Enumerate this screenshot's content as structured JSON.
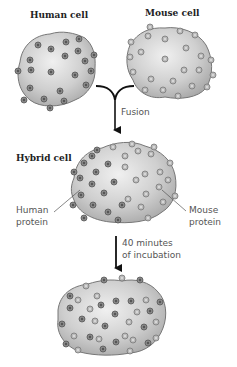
{
  "labels": {
    "human_cell": "Human cell",
    "mouse_cell": "Mouse cell",
    "fusion": "Fusion",
    "hybrid_cell": "Hybrid cell",
    "human_protein_line1": "Human",
    "human_protein_line2": "protein",
    "mouse_protein_line1": "Mouse",
    "mouse_protein_line2": "protein",
    "incubation_line1": "40 minutes",
    "incubation_line2": "of incubation"
  },
  "colors": {
    "cell_fill": "#c8c8c8",
    "cell_outline": "#7a7a7a",
    "human_protein": "#6e6e6e",
    "mouse_protein": "#a8a8a8",
    "arrow": "#111111"
  }
}
